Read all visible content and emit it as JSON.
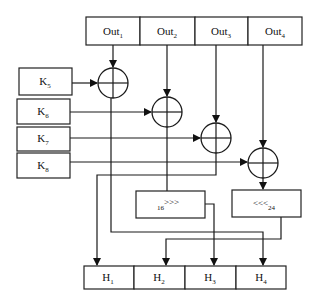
{
  "diagram": {
    "outputs": [
      {
        "base": "Out",
        "sub": "1"
      },
      {
        "base": "Out",
        "sub": "2"
      },
      {
        "base": "Out",
        "sub": "3"
      },
      {
        "base": "Out",
        "sub": "4"
      }
    ],
    "keys": [
      {
        "base": "K",
        "sub": "5"
      },
      {
        "base": "K",
        "sub": "6"
      },
      {
        "base": "K",
        "sub": "7"
      },
      {
        "base": "K",
        "sub": "8"
      }
    ],
    "rotations": {
      "right": {
        "amount": "16",
        "symbol": ">>>"
      },
      "left": {
        "symbol": "<<<",
        "amount": "24"
      }
    },
    "hashes": [
      {
        "base": "H",
        "sub": "1"
      },
      {
        "base": "H",
        "sub": "2"
      },
      {
        "base": "H",
        "sub": "3"
      },
      {
        "base": "H",
        "sub": "4"
      }
    ],
    "xor_operators": [
      "xor-1",
      "xor-2",
      "xor-3",
      "xor-4"
    ]
  }
}
